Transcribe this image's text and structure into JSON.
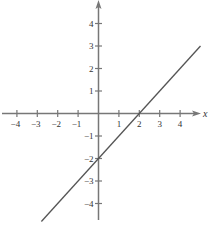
{
  "chart_data": {
    "type": "line",
    "title": "",
    "xlabel": "x",
    "ylabel": "",
    "xlim": [
      -4.8,
      5
    ],
    "ylim": [
      -4.8,
      5
    ],
    "x_ticks": [
      -4,
      -3,
      -2,
      -1,
      1,
      2,
      3,
      4
    ],
    "y_ticks": [
      4,
      3,
      2,
      1,
      -1,
      -2,
      -3,
      -4
    ],
    "x_tick_labels": [
      "−4",
      "−3",
      "−2",
      "−1",
      "1",
      "2",
      "3",
      "4"
    ],
    "y_tick_labels": [
      "4",
      "3",
      "2",
      "1",
      "−1",
      "−2",
      "−3",
      "−4"
    ],
    "grid": false,
    "legend": null,
    "series": [
      {
        "name": "y = x - 2",
        "x": [
          -2.8,
          5
        ],
        "y": [
          -4.8,
          3
        ],
        "color": "#555555"
      }
    ],
    "annotations": [
      {
        "label": "x-intercept",
        "x": 2,
        "y": 0
      },
      {
        "label": "y-intercept",
        "x": 0,
        "y": -2
      }
    ]
  },
  "colors": {
    "axis": "#777777",
    "line": "#555555",
    "text": "#333333"
  }
}
